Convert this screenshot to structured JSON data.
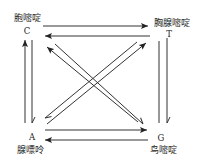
{
  "diagram": {
    "nodes": {
      "C": {
        "symbol": "C",
        "name": "胞嘧啶"
      },
      "T": {
        "symbol": "T",
        "name": "胸腺嘧啶"
      },
      "A": {
        "symbol": "A",
        "name": "腺嘌呤"
      },
      "G": {
        "symbol": "G",
        "name": "鸟嘧啶"
      }
    },
    "edges": [
      {
        "from": "C",
        "to": "T"
      },
      {
        "from": "T",
        "to": "C"
      },
      {
        "from": "A",
        "to": "C"
      },
      {
        "from": "C",
        "to": "A"
      },
      {
        "from": "G",
        "to": "T"
      },
      {
        "from": "T",
        "to": "G"
      },
      {
        "from": "A",
        "to": "G"
      },
      {
        "from": "G",
        "to": "A"
      },
      {
        "from": "G",
        "to": "C"
      },
      {
        "from": "C",
        "to": "G"
      },
      {
        "from": "A",
        "to": "T"
      },
      {
        "from": "T",
        "to": "A"
      }
    ]
  },
  "colors": {
    "line": "#333333",
    "text": "#222222",
    "background": "#ffffff"
  }
}
